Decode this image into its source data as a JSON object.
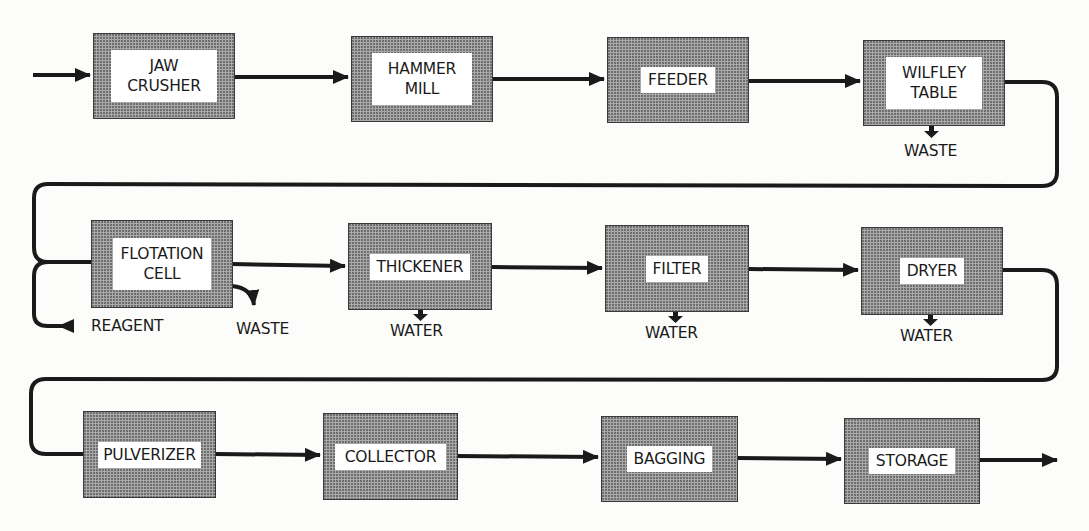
{
  "diagram": {
    "type": "process-flow",
    "colors": {
      "box_fill": "#a9a9a9",
      "line": "#1a1a1a",
      "label_bg": "#ffffff"
    },
    "rows": [
      {
        "steps": [
          {
            "id": "jaw-crusher",
            "line1": "JAW",
            "line2": "CRUSHER"
          },
          {
            "id": "hammer-mill",
            "line1": "HAMMER",
            "line2": "MILL"
          },
          {
            "id": "feeder",
            "line1": "FEEDER"
          },
          {
            "id": "wilfley-table",
            "line1": "WILFLEY",
            "line2": "TABLE",
            "output": "WASTE"
          }
        ]
      },
      {
        "steps": [
          {
            "id": "flotation-cell",
            "line1": "FLOTATION",
            "line2": "CELL",
            "output": "WASTE",
            "input": "REAGENT"
          },
          {
            "id": "thickener",
            "line1": "THICKENER",
            "output": "WATER"
          },
          {
            "id": "filter",
            "line1": "FILTER",
            "output": "WATER"
          },
          {
            "id": "dryer",
            "line1": "DRYER",
            "output": "WATER"
          }
        ]
      },
      {
        "steps": [
          {
            "id": "pulverizer",
            "line1": "PULVERIZER"
          },
          {
            "id": "collector",
            "line1": "COLLECTOR"
          },
          {
            "id": "bagging",
            "line1": "BAGGING"
          },
          {
            "id": "storage",
            "line1": "STORAGE"
          }
        ]
      }
    ]
  }
}
